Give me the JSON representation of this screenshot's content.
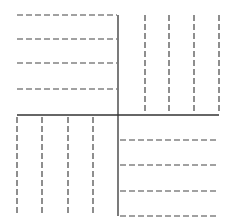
{
  "diagram": {
    "title": "",
    "colors": {
      "background": "#ffffff",
      "solid_line": "#333333",
      "dashed_line": "#444444"
    },
    "solid_lines": [
      {
        "name": "vertical-divider",
        "x1": 118,
        "y1": 15,
        "x2": 118,
        "y2": 216
      },
      {
        "name": "horizontal-divider",
        "x1": 17,
        "y1": 115,
        "x2": 219,
        "y2": 115
      }
    ],
    "quadrants": [
      {
        "name": "top-left",
        "orientation": "horizontal",
        "lines": [
          {
            "x1": 17,
            "y1": 15,
            "x2": 117,
            "y2": 15
          },
          {
            "x1": 17,
            "y1": 39,
            "x2": 117,
            "y2": 39
          },
          {
            "x1": 17,
            "y1": 63,
            "x2": 117,
            "y2": 63
          },
          {
            "x1": 17,
            "y1": 89,
            "x2": 117,
            "y2": 89
          }
        ]
      },
      {
        "name": "top-right",
        "orientation": "vertical",
        "lines": [
          {
            "x1": 145,
            "y1": 15,
            "x2": 145,
            "y2": 113
          },
          {
            "x1": 169,
            "y1": 15,
            "x2": 169,
            "y2": 113
          },
          {
            "x1": 194,
            "y1": 15,
            "x2": 194,
            "y2": 113
          },
          {
            "x1": 219,
            "y1": 15,
            "x2": 219,
            "y2": 113
          }
        ]
      },
      {
        "name": "bottom-left",
        "orientation": "vertical",
        "lines": [
          {
            "x1": 17,
            "y1": 117,
            "x2": 17,
            "y2": 216
          },
          {
            "x1": 42,
            "y1": 117,
            "x2": 42,
            "y2": 216
          },
          {
            "x1": 68,
            "y1": 117,
            "x2": 68,
            "y2": 216
          },
          {
            "x1": 93,
            "y1": 117,
            "x2": 93,
            "y2": 216
          }
        ]
      },
      {
        "name": "bottom-right",
        "orientation": "horizontal",
        "lines": [
          {
            "x1": 120,
            "y1": 140,
            "x2": 219,
            "y2": 140
          },
          {
            "x1": 120,
            "y1": 165,
            "x2": 219,
            "y2": 165
          },
          {
            "x1": 120,
            "y1": 191,
            "x2": 219,
            "y2": 191
          },
          {
            "x1": 120,
            "y1": 216,
            "x2": 219,
            "y2": 216
          }
        ]
      }
    ]
  }
}
